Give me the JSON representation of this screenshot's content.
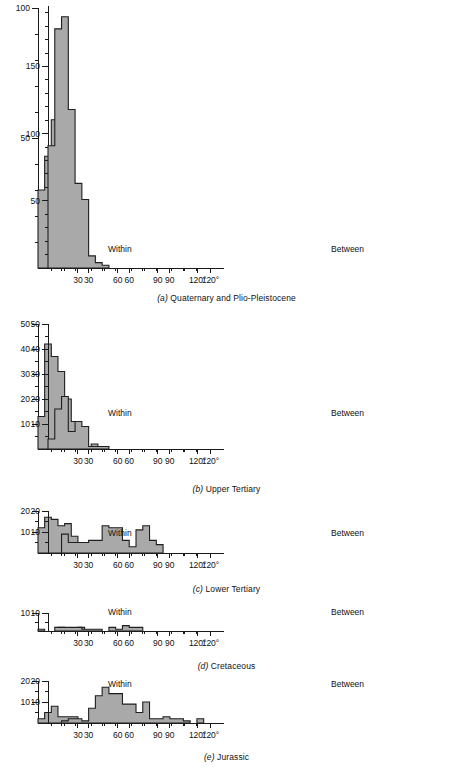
{
  "figure": {
    "bar_fill": "#a9a9a9",
    "bar_stroke": "#1f1f1f",
    "axis_color": "#1a1a1a",
    "degree_suffix": "°"
  },
  "panels": [
    {
      "id": "a",
      "letter": "(a)",
      "caption": "Quaternary and Plio-Pleistocene",
      "within_label": "Within",
      "between_label": "Between",
      "ymax": 100,
      "ytick_major": [
        50,
        100
      ],
      "ytick_minor_step": 10,
      "xticks": [
        30,
        60,
        90,
        120
      ],
      "xmax": 130,
      "binwidth": 5,
      "within_ymax": 100,
      "between_ymax": 195,
      "between_ytick_major": [
        50,
        100,
        150
      ]
    },
    {
      "id": "b",
      "letter": "(b)",
      "caption": "Upper Tertiary",
      "within_label": "Within",
      "between_label": "Between",
      "ymax": 50,
      "ytick_major": [
        10,
        20,
        30,
        40,
        50
      ],
      "xticks": [
        30,
        60,
        90,
        120
      ],
      "xmax": 130,
      "binwidth": 5
    },
    {
      "id": "c",
      "letter": "(c)",
      "caption": "Lower Tertiary",
      "within_label": "Within",
      "between_label": "Between",
      "ymax": 20,
      "ytick_major": [
        10,
        20
      ],
      "xticks": [
        30,
        60,
        90,
        120
      ],
      "xmax": 130,
      "binwidth": 5
    },
    {
      "id": "d",
      "letter": "(d)",
      "caption": "Cretaceous",
      "within_label": "Within",
      "between_label": "Between",
      "ymax": 10,
      "ytick_major": [
        10
      ],
      "xticks": [
        30,
        60,
        90,
        120
      ],
      "xmax": 130,
      "binwidth": 5
    },
    {
      "id": "e",
      "letter": "(e)",
      "caption": "Jurassic",
      "within_label": "Within",
      "between_label": "Between",
      "ymax": 20,
      "ytick_major": [
        10,
        20
      ],
      "xticks": [
        30,
        60,
        90,
        120
      ],
      "xmax": 130,
      "binwidth": 5
    }
  ],
  "chart_data": [
    {
      "type": "bar",
      "title": "(a) Quaternary and Plio-Pleistocene — Within",
      "xlabel": "Angular dispersion (degrees)",
      "ylabel": "Frequency",
      "xlim": [
        0,
        130
      ],
      "ylim": [
        0,
        100
      ],
      "binwidth": 5,
      "bin_starts": [
        0,
        5,
        10,
        15,
        20,
        25,
        30
      ],
      "values": [
        30,
        43,
        57,
        35,
        20,
        8,
        2
      ],
      "grid": false
    },
    {
      "type": "bar",
      "title": "(a) Quaternary and Plio-Pleistocene — Between",
      "xlabel": "Angular dispersion (degrees)",
      "ylabel": "Frequency",
      "xlim": [
        0,
        130
      ],
      "ylim": [
        0,
        195
      ],
      "binwidth": 5,
      "bin_starts": [
        0,
        5,
        10,
        15,
        20,
        25,
        30,
        35,
        40
      ],
      "values": [
        91,
        178,
        187,
        118,
        63,
        51,
        9,
        4,
        2
      ],
      "grid": false
    },
    {
      "type": "bar",
      "title": "(b) Upper Tertiary — Within",
      "xlabel": "Angular dispersion (degrees)",
      "ylabel": "Frequency",
      "xlim": [
        0,
        130
      ],
      "ylim": [
        0,
        50
      ],
      "binwidth": 5,
      "bin_starts": [
        0,
        5,
        10,
        15,
        20,
        25,
        30,
        40
      ],
      "values": [
        13,
        42,
        37,
        31,
        20,
        11,
        9,
        2
      ],
      "grid": false
    },
    {
      "type": "bar",
      "title": "(b) Upper Tertiary — Between",
      "xlabel": "Angular dispersion (degrees)",
      "ylabel": "Frequency",
      "xlim": [
        0,
        130
      ],
      "ylim": [
        0,
        50
      ],
      "binwidth": 5,
      "bin_starts": [
        0,
        5,
        10,
        15,
        20,
        25,
        30,
        35,
        40
      ],
      "values": [
        4,
        16,
        21,
        7,
        11,
        9,
        1,
        1,
        1
      ],
      "grid": false
    },
    {
      "type": "bar",
      "title": "(c) Lower Tertiary — Within",
      "xlabel": "Angular dispersion (degrees)",
      "ylabel": "Frequency",
      "xlim": [
        0,
        130
      ],
      "ylim": [
        0,
        20
      ],
      "binwidth": 5,
      "bin_starts": [
        0,
        5,
        10,
        15,
        20,
        25,
        30,
        35,
        55
      ],
      "values": [
        12,
        17,
        16,
        13,
        14,
        8,
        1,
        4,
        1
      ],
      "grid": false
    },
    {
      "type": "bar",
      "title": "(c) Lower Tertiary — Between",
      "xlabel": "Angular dispersion (degrees)",
      "ylabel": "Frequency",
      "xlim": [
        0,
        130
      ],
      "ylim": [
        0,
        20
      ],
      "binwidth": 5,
      "bin_starts": [
        10,
        15,
        20,
        25,
        30,
        35,
        40,
        45,
        50,
        55,
        60,
        65,
        70,
        75,
        80
      ],
      "values": [
        9,
        5,
        5,
        5,
        6,
        6,
        13,
        12,
        12,
        6,
        3,
        11,
        13,
        6,
        4
      ],
      "grid": false
    },
    {
      "type": "bar",
      "title": "(d) Cretaceous — Within",
      "xlabel": "Angular dispersion (degrees)",
      "ylabel": "Frequency",
      "xlim": [
        0,
        130
      ],
      "ylim": [
        0,
        10
      ],
      "binwidth": 5,
      "bin_starts": [
        0,
        15,
        30
      ],
      "values": [
        1,
        2,
        2
      ],
      "grid": false
    },
    {
      "type": "bar",
      "title": "(d) Cretaceous — Between",
      "xlabel": "Angular dispersion (degrees)",
      "ylabel": "Frequency",
      "xlim": [
        0,
        130
      ],
      "ylim": [
        0,
        10
      ],
      "binwidth": 5,
      "bin_starts": [
        5,
        10,
        15,
        20,
        25,
        30,
        35,
        45,
        50,
        55,
        60,
        65
      ],
      "values": [
        2,
        2,
        2,
        2,
        1,
        1,
        1,
        2,
        1,
        3,
        2,
        2
      ],
      "grid": false
    },
    {
      "type": "bar",
      "title": "(e) Jurassic — Within",
      "xlabel": "Angular dispersion (degrees)",
      "ylabel": "Frequency",
      "xlim": [
        0,
        130
      ],
      "ylim": [
        0,
        20
      ],
      "binwidth": 5,
      "bin_starts": [
        0,
        5,
        10,
        15,
        20,
        25,
        45,
        75
      ],
      "values": [
        2,
        5,
        8,
        3,
        3,
        3,
        2,
        1
      ],
      "grid": false
    },
    {
      "type": "bar",
      "title": "(e) Jurassic — Between",
      "xlabel": "Angular dispersion (degrees)",
      "ylabel": "Frequency",
      "xlim": [
        0,
        130
      ],
      "ylim": [
        0,
        20
      ],
      "binwidth": 5,
      "bin_starts": [
        10,
        15,
        20,
        25,
        30,
        35,
        40,
        45,
        50,
        55,
        60,
        65,
        70,
        75,
        80,
        85,
        90,
        95,
        100,
        110
      ],
      "values": [
        1,
        2,
        2,
        1,
        7,
        13,
        17,
        14,
        14,
        9,
        9,
        5,
        10,
        2,
        2,
        3,
        2,
        2,
        1,
        2
      ],
      "grid": false
    }
  ]
}
